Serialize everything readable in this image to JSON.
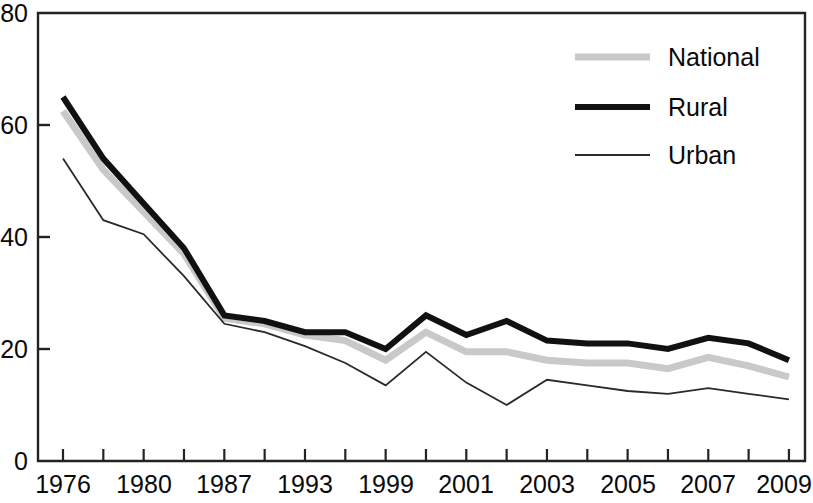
{
  "chart_data": {
    "type": "line",
    "title": "",
    "subtitle": "",
    "xlabel": "",
    "ylabel": "",
    "xlim": [
      0,
      18
    ],
    "ylim": [
      0,
      80
    ],
    "grid": false,
    "legend_position": "top-right",
    "y_ticks": [
      0,
      20,
      40,
      60,
      80
    ],
    "y_tick_labels": [
      "0",
      "20",
      "40",
      "60",
      "80"
    ],
    "x_tick_count": 19,
    "x_tick_labels": [
      "1976",
      "",
      "1980",
      "",
      "1987",
      "",
      "1993",
      "",
      "1999",
      "",
      "2001",
      "",
      "2003",
      "",
      "2005",
      "",
      "2007",
      "",
      "2009"
    ],
    "x_labeled": [
      "1976",
      "1980",
      "1987",
      "1993",
      "1999",
      "2001",
      "2003",
      "2005",
      "2007",
      "2009"
    ],
    "x_labeled_indices": [
      0,
      2,
      4,
      6,
      8,
      10,
      12,
      14,
      16,
      18
    ],
    "x": [
      0,
      1,
      2,
      3,
      4,
      5,
      6,
      7,
      8,
      9,
      10,
      11,
      12,
      13,
      14,
      15,
      16,
      17,
      18
    ],
    "series": [
      {
        "name": "National",
        "color": "#c9c9c9",
        "width": 7,
        "values": [
          62.5,
          52.0,
          44.5,
          37.0,
          25.5,
          24.5,
          22.5,
          21.5,
          18.0,
          23.0,
          19.5,
          19.5,
          18.0,
          17.5,
          17.5,
          16.5,
          18.5,
          17.0,
          15.0
        ]
      },
      {
        "name": "Rural",
        "color": "#111111",
        "width": 6,
        "values": [
          65.0,
          54.0,
          46.0,
          38.0,
          26.0,
          25.0,
          23.0,
          23.0,
          20.0,
          26.0,
          22.5,
          25.0,
          21.5,
          21.0,
          21.0,
          20.0,
          22.0,
          21.0,
          18.0
        ]
      },
      {
        "name": "Urban",
        "color": "#2a2a2a",
        "width": 1.8,
        "values": [
          54.0,
          43.0,
          40.5,
          33.0,
          24.5,
          23.0,
          20.5,
          17.5,
          13.5,
          19.5,
          14.0,
          10.0,
          14.5,
          13.5,
          12.5,
          12.0,
          13.0,
          12.0,
          11.0
        ]
      }
    ],
    "legend": [
      {
        "label": "National",
        "color": "#c9c9c9",
        "width": 7
      },
      {
        "label": "Rural",
        "color": "#111111",
        "width": 6
      },
      {
        "label": "Urban",
        "color": "#2a2a2a",
        "width": 1.8
      }
    ]
  },
  "axes": {
    "y_labels": [
      "80",
      "60",
      "40",
      "20",
      "0"
    ],
    "y_values": [
      80,
      60,
      40,
      20,
      0
    ]
  },
  "legend_text": {
    "item0": "National",
    "item1": "Rural",
    "item2": "Urban"
  },
  "x_axis_labels": {
    "l0": "1976",
    "l1": "1980",
    "l2": "1987",
    "l3": "1993",
    "l4": "1999",
    "l5": "2001",
    "l6": "2003",
    "l7": "2005",
    "l8": "2007",
    "l9": "2009"
  },
  "y_axis_labels": {
    "l0": "80",
    "l1": "60",
    "l2": "40",
    "l3": "20",
    "l4": "0"
  }
}
